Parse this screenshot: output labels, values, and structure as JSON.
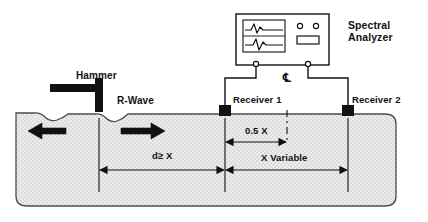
{
  "diagram": {
    "labels": {
      "analyzer": "Spectral\nAnalyzer",
      "analyzer_line1": "Spectral",
      "analyzer_line2": "Analyzer",
      "hammer": "Hammer",
      "rwave": "R-Wave",
      "receiver1": "Receiver 1",
      "receiver2": "Receiver 2",
      "centerline_symbol": "℄"
    },
    "dimensions": [
      {
        "name": "source-to-receiver1",
        "label": "d≥ X",
        "from": "impact-point",
        "to": "receiver-1"
      },
      {
        "name": "receiver1-to-centerline",
        "label": "0.5 X",
        "from": "receiver-1",
        "to": "centerline"
      },
      {
        "name": "receiver-spacing",
        "label": "X Variable",
        "from": "receiver-1",
        "to": "receiver-2"
      }
    ],
    "colors": {
      "ink": "#111111",
      "concrete_fill": "#e8e8e8",
      "concrete_stroke": "#555555",
      "white": "#ffffff"
    },
    "instrument": {
      "name": "spectral-analyzer",
      "screen_traces": 2,
      "indicator_lights": 2,
      "display_panels": 1,
      "connectors": 2
    },
    "wave_arrows": [
      {
        "name": "arrow-left",
        "direction": "left"
      },
      {
        "name": "arrow-right",
        "direction": "right"
      }
    ]
  }
}
